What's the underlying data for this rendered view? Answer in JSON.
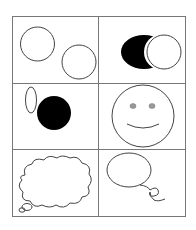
{
  "figure": {
    "layout": "3x2 grid of line-drawing panels",
    "line_color": "#555555",
    "fill_color": "#000000",
    "eye_color": "#999999",
    "panels": [
      {
        "id": "two-circles",
        "description": "Two outlined circles"
      },
      {
        "id": "crescent-eclipse",
        "description": "Black crescent shape behind outlined circle"
      },
      {
        "id": "ellipse-and-black-circle",
        "description": "Thin outlined ellipse beside filled black circle"
      },
      {
        "id": "smiley-face",
        "description": "Smiley face with two grey eyes"
      },
      {
        "id": "thought-bubble",
        "description": "Cloud-shaped thought bubble"
      },
      {
        "id": "speech-bubble",
        "description": "Oval speech bubble with curly tail"
      }
    ]
  }
}
